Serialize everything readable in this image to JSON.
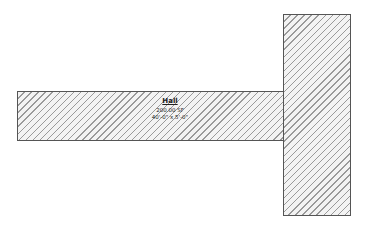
{
  "floor_plan": {
    "rooms": [
      {
        "id": "hall",
        "name": "Hall",
        "area": "200.00 SF",
        "dimensions": "40'-0\" x 5'-0\""
      },
      {
        "id": "adjacent-room",
        "name": ""
      }
    ],
    "colors": {
      "outline": "#555555",
      "hatch": "#9a9a9a",
      "fill": "#f3f3f3",
      "background": "#ffffff"
    }
  }
}
